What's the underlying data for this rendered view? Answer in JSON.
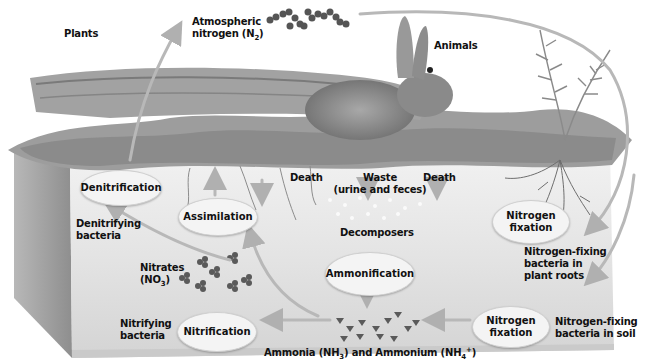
{
  "diagram": {
    "type": "nitrogen-cycle-illustration",
    "labels": {
      "plants": "Plants",
      "atmospheric_nitrogen_line1": "Atmospheric",
      "atmospheric_nitrogen_line2": "nitrogen (N",
      "atmospheric_nitrogen_sub": "2",
      "atmospheric_nitrogen_end": ")",
      "animals": "Animals",
      "death_left": "Death",
      "waste_line1": "Waste",
      "waste_line2": "(urine and feces)",
      "death_right": "Death",
      "decomposers": "Decomposers",
      "denitrifying_line1": "Denitrifying",
      "denitrifying_line2": "bacteria",
      "nitrates_line1": "Nitrates",
      "nitrates_line2": "(NO",
      "nitrates_sub": "3",
      "nitrates_end": ")",
      "nitrifying_line1": "Nitrifying",
      "nitrifying_line2": "bacteria",
      "ammonia_prefix": "Ammonia (NH",
      "ammonia_sub": "3",
      "ammonia_mid": ") and Ammonium (NH",
      "ammonium_sub": "4",
      "ammonium_sup": "+",
      "ammonia_end": ")",
      "fixing_roots_line1": "Nitrogen-fixing",
      "fixing_roots_line2": "bacteria in",
      "fixing_roots_line3": "plant roots",
      "fixing_soil_line1": "Nitrogen-fixing",
      "fixing_soil_line2": "bacteria in soil"
    },
    "processes": {
      "denitrification": "Denitrification",
      "assimilation": "Assimilation",
      "ammonification": "Ammonification",
      "nitrification": "Nitrification",
      "fixation_roots_line1": "Nitrogen",
      "fixation_roots_line2": "fixation",
      "fixation_soil_line1": "Nitrogen",
      "fixation_soil_line2": "fixation"
    },
    "colors": {
      "soil_face": "#e6e6e6",
      "soil_side": "#9a9a9a",
      "arrow": "#b8b8b8",
      "oval_fill": "#f4f4f4",
      "molecule": "#555555",
      "text": "#111111"
    }
  }
}
